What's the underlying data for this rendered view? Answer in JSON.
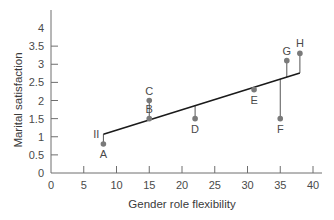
{
  "chart_data": {
    "type": "scatter",
    "title": "",
    "xlabel": "Gender role flexibility",
    "ylabel": "Marital satisfaction",
    "xlim": [
      0,
      40
    ],
    "ylim": [
      0,
      4
    ],
    "x_ticks": [
      0,
      5,
      10,
      15,
      20,
      25,
      30,
      35,
      40
    ],
    "y_ticks": [
      0,
      0.5,
      1,
      1.5,
      2,
      2.5,
      3,
      3.5,
      4
    ],
    "y_tick_labels": [
      "0",
      "0.5",
      "1",
      "1.5",
      "2",
      "2.5",
      "3",
      "3.5",
      "4"
    ],
    "grid": false,
    "legend": null,
    "points": [
      {
        "label": "A",
        "x": 8,
        "y": 0.8
      },
      {
        "label": "B",
        "x": 15,
        "y": 1.5
      },
      {
        "label": "C",
        "x": 15,
        "y": 2.0
      },
      {
        "label": "D",
        "x": 22,
        "y": 1.5
      },
      {
        "label": "E",
        "x": 31,
        "y": 2.3
      },
      {
        "label": "F",
        "x": 35,
        "y": 1.5
      },
      {
        "label": "G",
        "x": 36,
        "y": 3.1
      },
      {
        "label": "H",
        "x": 38,
        "y": 3.3
      }
    ],
    "regression_line": {
      "x_start": 8,
      "y_start": 1.07,
      "x_end": 38,
      "y_end": 2.76
    },
    "residuals_shown": true,
    "annotations": [
      {
        "text": "II",
        "x": 8,
        "y": 1.07,
        "note": "line start marker"
      }
    ],
    "colors": {
      "axis": "#6e6e6e",
      "point": "#7a7a7a",
      "line": "#1a1a1a",
      "residual": "#555555"
    }
  }
}
